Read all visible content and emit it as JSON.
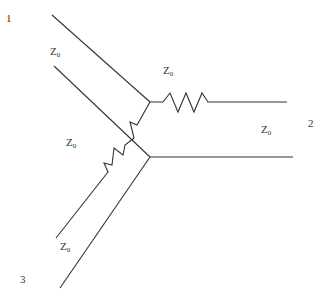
{
  "diagram": {
    "type": "three-port resistive power divider (Y network with transmission lines)",
    "ports": [
      {
        "id": "port-1",
        "label": "1"
      },
      {
        "id": "port-2",
        "label": "2"
      },
      {
        "id": "port-3",
        "label": "3"
      }
    ],
    "impedance_labels": [
      {
        "id": "z0-port1",
        "main": "Z",
        "sub": "0"
      },
      {
        "id": "z0-top-resistor",
        "main": "Z",
        "sub": "0"
      },
      {
        "id": "z0-middle-resistor",
        "main": "Z",
        "sub": "0"
      },
      {
        "id": "z0-port2",
        "main": "Z",
        "sub": "0"
      },
      {
        "id": "z0-port3",
        "main": "Z",
        "sub": "0"
      }
    ],
    "line_color": "#333333",
    "background": "#ffffff"
  }
}
